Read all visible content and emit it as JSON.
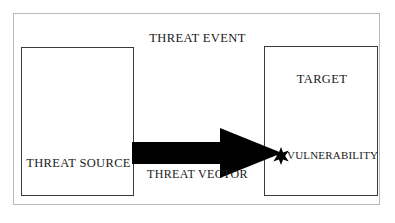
{
  "diagram": {
    "title": "THREAT EVENT",
    "nodes": {
      "threat_source": {
        "label": "THREAT SOURCE",
        "name": "threat-source"
      },
      "target": {
        "label": "TARGET",
        "name": "target"
      },
      "vulnerability": {
        "label": "VULNERABILITY",
        "name": "vulnerability",
        "marker_icon": "burst-star-icon"
      }
    },
    "connector": {
      "label": "THREAT VECTOR",
      "icon": "right-arrow-icon",
      "from": "THREAT SOURCE",
      "to": "VULNERABILITY",
      "direction": "left-to-right"
    },
    "colors": {
      "outer_frame_border": "#b9b9b9",
      "box_border": "#3a3a3a",
      "arrow_fill": "#000000",
      "text": "#1a1a1a",
      "background": "#ffffff"
    }
  }
}
